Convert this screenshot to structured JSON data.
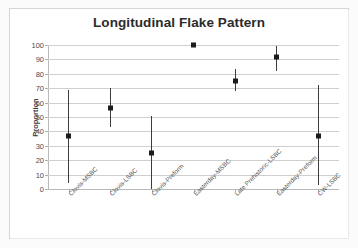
{
  "chart": {
    "title": "Longitudinal Flake Pattern",
    "yaxis_title": "Proportion"
  },
  "chart_data": {
    "type": "scatter",
    "title": "Longitudinal Flake Pattern",
    "xlabel": "",
    "ylabel": "Proportion",
    "ylim": [
      0,
      100
    ],
    "yticks": [
      0,
      10,
      20,
      30,
      40,
      50,
      60,
      70,
      80,
      90,
      100
    ],
    "ytick_labels": [
      "0",
      "10",
      "20",
      "30",
      "40",
      "50",
      "60",
      "70",
      "80",
      "90",
      "100"
    ],
    "grid": true,
    "legend": false,
    "error_bars": "vertical",
    "marker": "square",
    "marker_color": "#1c1c1c",
    "categories": [
      "Clovis-MSBC",
      "Clovis-LSBC",
      "Clovis-Preform",
      "Easterday-MSBC",
      "Late Prehistoric-LSBC",
      "Easterday-Preform",
      "CW-LSBC"
    ],
    "values": [
      37,
      56,
      25,
      100,
      75,
      92,
      37
    ],
    "error_low": [
      4,
      43,
      0,
      100,
      68,
      82,
      3
    ],
    "error_high": [
      69,
      70,
      51,
      100,
      83,
      99,
      72
    ]
  }
}
